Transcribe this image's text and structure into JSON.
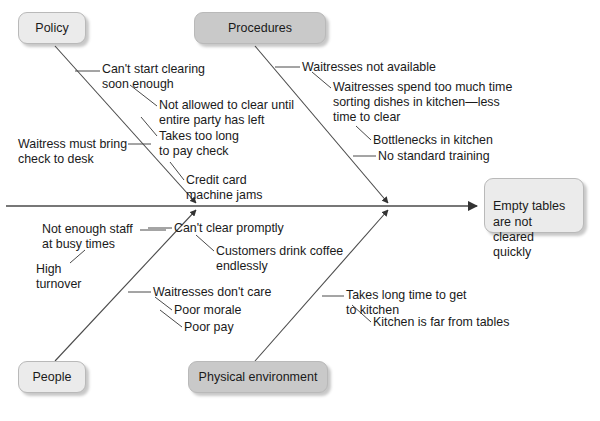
{
  "diagram": {
    "type": "fishbone-cause-and-effect",
    "effect": {
      "label": "Empty tables\nare not cleared\nquickly"
    },
    "categories": [
      {
        "id": "policy",
        "label": "Policy",
        "shade": "light",
        "position": "top-left"
      },
      {
        "id": "procedures",
        "label": "Procedures",
        "shade": "dark",
        "position": "top-right"
      },
      {
        "id": "people",
        "label": "People",
        "shade": "light",
        "position": "bottom-left"
      },
      {
        "id": "physical-environment",
        "label": "Physical environment",
        "shade": "dark",
        "position": "bottom-right"
      }
    ],
    "causes": [
      {
        "id": "cant-start-clearing",
        "category": "policy",
        "label": "Can't start clearing\nsoon enough"
      },
      {
        "id": "not-allowed-to-clear",
        "category": "policy",
        "label": "Not allowed to clear until\nentire party has left"
      },
      {
        "id": "takes-too-long-pay-check",
        "category": "policy",
        "label": "Takes too long\nto pay check"
      },
      {
        "id": "waitress-must-bring-check",
        "category": "policy",
        "label": "Waitress must bring\ncheck to desk"
      },
      {
        "id": "credit-card-machine-jams",
        "category": "policy",
        "label": "Credit card\nmachine jams"
      },
      {
        "id": "waitresses-not-available",
        "category": "procedures",
        "label": "Waitresses not available"
      },
      {
        "id": "waitresses-sorting-dishes",
        "category": "procedures",
        "label": "Waitresses spend too much time\nsorting dishes in kitchen—less\ntime to clear"
      },
      {
        "id": "bottlenecks-in-kitchen",
        "category": "procedures",
        "label": "Bottlenecks in kitchen"
      },
      {
        "id": "no-standard-training",
        "category": "procedures",
        "label": "No standard training"
      },
      {
        "id": "not-enough-staff",
        "category": "people",
        "label": "Not enough staff\nat busy times"
      },
      {
        "id": "high-turnover",
        "category": "people",
        "label": "High\nturnover"
      },
      {
        "id": "waitresses-dont-care",
        "category": "people",
        "label": "Waitresses don't care"
      },
      {
        "id": "poor-morale",
        "category": "people",
        "label": "Poor morale"
      },
      {
        "id": "poor-pay",
        "category": "people",
        "label": "Poor pay"
      },
      {
        "id": "cant-clear-promptly",
        "category": "physical-environment",
        "label": "Can't clear promptly"
      },
      {
        "id": "customers-drink-coffee",
        "category": "physical-environment",
        "label": "Customers drink coffee\nendlessly"
      },
      {
        "id": "takes-long-time-to-kitchen",
        "category": "physical-environment",
        "label": "Takes long time to get\nto kitchen"
      },
      {
        "id": "kitchen-far-from-tables",
        "category": "physical-environment",
        "label": "Kitchen is far from tables"
      }
    ],
    "colors": {
      "line": "#4a4a4a",
      "box_light": "#ebebeb",
      "box_dark": "#c9c9c9",
      "box_border": "#b9b9b9",
      "text": "#1a1a1a",
      "background": "#ffffff"
    }
  }
}
